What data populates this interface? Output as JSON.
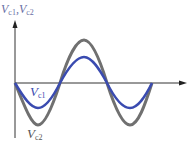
{
  "diagram": {
    "axis_label": {
      "base1": "V",
      "sub1": "c1",
      "sep": ",",
      "base2": "V",
      "sub2": "c2"
    },
    "curve_labels": [
      {
        "base": "V",
        "sub": "c1",
        "color": "#3a4bb0"
      },
      {
        "base": "V",
        "sub": "c2",
        "color": "#6b6b6b"
      }
    ],
    "colors": {
      "vc1": "#3a4bb0",
      "vc2": "#707070",
      "axis": "#333333"
    }
  }
}
